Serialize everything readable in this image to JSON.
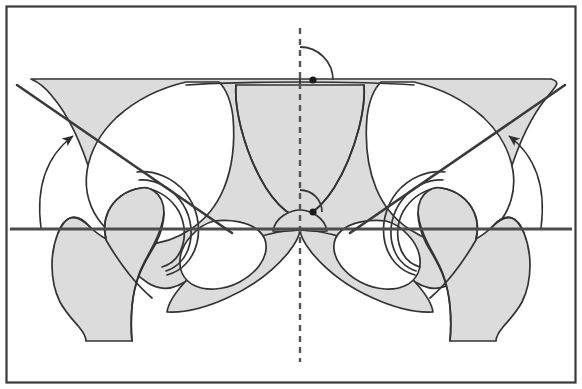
{
  "figure": {
    "caption": "",
    "width": 582,
    "height": 389
  },
  "colors": {
    "background": "#ffffff",
    "bone_fill": "#dcdcdc",
    "bone_outline": "#333333",
    "reference_line": "#4d4d4d",
    "measurement_line": "#3a3a3a",
    "frame_border": "#3a3a3a",
    "dashed_axis": "#555555",
    "vertex_dot": "#1a1a1a"
  },
  "frame": {
    "name": "image-border",
    "inset_px": 6,
    "stroke_width": 2
  },
  "annotations": {
    "horizontal_reference": {
      "label": "Hilgenreiner horizontal reference line",
      "y_px": 229,
      "x_start_px": 10,
      "x_end_px": 572,
      "stroke_width": 3
    },
    "vertical_axis": {
      "label": "midline vertical axis",
      "x_px": 300,
      "y_start_px": 28,
      "y_end_px": 362,
      "dash": "6 5",
      "stroke_width": 2.4
    },
    "angle_vertices": [
      {
        "name": "upper-vertex-dot",
        "x_px": 313,
        "y_px": 80,
        "r_px": 3.6
      },
      {
        "name": "lower-vertex-dot",
        "x_px": 313,
        "y_px": 212,
        "r_px": 3.6
      }
    ],
    "angle_arcs": [
      {
        "name": "upper-angle-arc",
        "vertex_x": 300,
        "vertex_y": 80,
        "radius_px": 33
      },
      {
        "name": "lower-angle-arc",
        "vertex_x": 300,
        "vertex_y": 212,
        "radius_px": 22
      }
    ],
    "oblique_lines": [
      {
        "name": "left-acetabular-roof-line",
        "x1": 17,
        "y1": 85,
        "x2": 232,
        "y2": 233
      },
      {
        "name": "right-acetabular-roof-line",
        "x1": 565,
        "y1": 85,
        "x2": 350,
        "y2": 233
      }
    ],
    "angle_arrows": [
      {
        "name": "left-angle-arrow",
        "from_x": 40,
        "from_y": 228,
        "to_x": 75,
        "to_y": 133
      },
      {
        "name": "right-angle-arrow",
        "from_x": 542,
        "from_y": 228,
        "to_x": 507,
        "to_y": 133
      }
    ]
  },
  "anatomy": {
    "regions": [
      {
        "name": "left-iliac-wing",
        "fill": "bone_fill"
      },
      {
        "name": "right-iliac-wing",
        "fill": "bone_fill"
      },
      {
        "name": "sacrum",
        "fill": "bone_fill"
      },
      {
        "name": "left-obturator-foramen",
        "fill": "background"
      },
      {
        "name": "right-obturator-foramen",
        "fill": "background"
      },
      {
        "name": "left-femoral-head",
        "fill": "bone_fill"
      },
      {
        "name": "right-femoral-head",
        "fill": "bone_fill"
      },
      {
        "name": "left-femoral-shaft",
        "fill": "bone_fill"
      },
      {
        "name": "right-femoral-shaft",
        "fill": "bone_fill"
      },
      {
        "name": "left-acetabulum",
        "fill": "bone_fill"
      },
      {
        "name": "right-acetabulum",
        "fill": "bone_fill"
      }
    ]
  },
  "measurements": {
    "left_angle_label": "",
    "right_angle_label": "",
    "units": ""
  }
}
